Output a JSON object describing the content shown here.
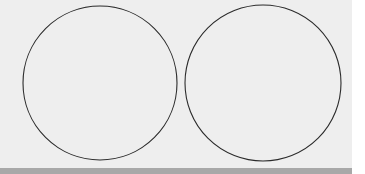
{
  "figure": {
    "circles": [
      {
        "id": "left-circle",
        "label": ""
      },
      {
        "id": "right-circle",
        "label": ""
      }
    ],
    "colors": {
      "background": "#eeeeee",
      "stroke": "#2a2a2a",
      "bottom_bar": "#a8a8a8",
      "margin": "#ffffff"
    }
  }
}
